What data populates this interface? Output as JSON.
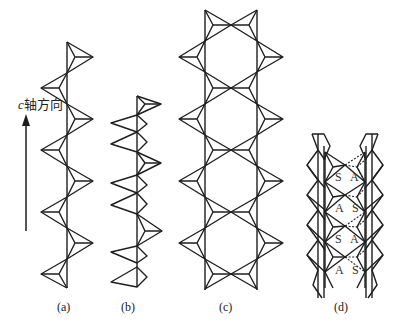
{
  "axis": {
    "symbol": "c",
    "label_suffix": "轴方向",
    "direction": "up"
  },
  "panels": [
    {
      "id": "a",
      "label": "(a)",
      "description": "single tetrahedral chain, alternating apices, period 2"
    },
    {
      "id": "b",
      "label": "(b)",
      "description": "single tetrahedral chain with longer repeat"
    },
    {
      "id": "c",
      "label": "(c)",
      "description": "double chain forming hexagonal rings"
    },
    {
      "id": "d",
      "label": "(d)",
      "description": "ribbon / band structure with S and A positions"
    }
  ],
  "panel_d_sites": [
    {
      "left": "S",
      "right": "A"
    },
    {
      "left": "A",
      "right": "S"
    },
    {
      "left": "S",
      "right": "A"
    },
    {
      "left": "A",
      "right": "S"
    }
  ],
  "colors": {
    "line": "#1e1e1e",
    "background": "#ffffff"
  }
}
